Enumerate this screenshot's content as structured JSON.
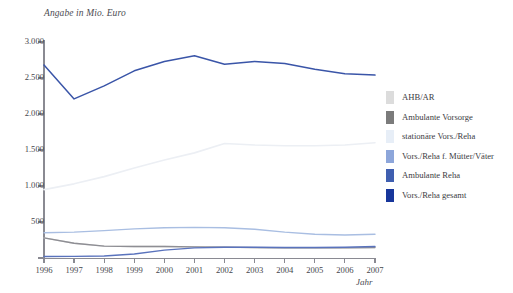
{
  "header": {
    "clipped_line_a": "",
    "clipped_line_b": ""
  },
  "chart": {
    "subtitle": "Angabe in Mio. Euro",
    "xaxis_title": "Jahr"
  },
  "legend": {
    "items": [
      {
        "label": "AHB/AR",
        "color": "#dcdcdc"
      },
      {
        "label": "Ambulante Vorsorge",
        "color": "#7b7b7b"
      },
      {
        "label": "stationäre Vors./Reha",
        "color": "#e7eef7"
      },
      {
        "label": "Vors./Reha f. Mütter/Väter",
        "color": "#8da6da"
      },
      {
        "label": "Ambulante Reha",
        "color": "#3f5fb0"
      },
      {
        "label": "Vors./Reha gesamt",
        "color": "#17369b"
      }
    ]
  },
  "chart_data": {
    "type": "line",
    "title": "",
    "subtitle": "Angabe in Mio. Euro",
    "xlabel": "Jahr",
    "ylabel": "",
    "grid": false,
    "legend_position": "right",
    "x": [
      1996,
      1997,
      1998,
      1999,
      2000,
      2001,
      2002,
      2003,
      2004,
      2005,
      2006,
      2007
    ],
    "categories": [
      "1996",
      "1997",
      "1998",
      "1999",
      "2000",
      "2001",
      "2002",
      "2003",
      "2004",
      "2005",
      "2006",
      "2007"
    ],
    "xlim": [
      1996,
      2007
    ],
    "ylim": [
      0,
      3000
    ],
    "yticks": [
      0,
      500,
      1000,
      1500,
      2000,
      2500,
      3000
    ],
    "ytick_labels": [
      "",
      "500",
      "1.000",
      "1.500",
      "2.000",
      "2.500",
      "3.000"
    ],
    "series": [
      {
        "name": "Vors./Reha gesamt",
        "color": "#3a55a8",
        "width": 1.5,
        "values": [
          2680,
          2210,
          2390,
          2600,
          2730,
          2810,
          2690,
          2730,
          2700,
          2620,
          2560,
          2540
        ]
      },
      {
        "name": "stationäre Vors./Reha",
        "color": "#eceff4",
        "width": 1.6,
        "values": [
          950,
          1030,
          1130,
          1250,
          1360,
          1460,
          1590,
          1570,
          1560,
          1560,
          1570,
          1600
        ]
      },
      {
        "name": "Vors./Reha f. Mütter/Väter",
        "color": "#a9bee2",
        "width": 1.4,
        "values": [
          350,
          360,
          380,
          405,
          420,
          425,
          420,
          400,
          360,
          330,
          320,
          330
        ]
      },
      {
        "name": "AHB/AR",
        "color": "#d6d6d6",
        "width": 1.4,
        "values": [
          280,
          205,
          165,
          160,
          160,
          155,
          150,
          145,
          140,
          140,
          140,
          145
        ]
      },
      {
        "name": "Ambulante Vorsorge",
        "color": "#8e8e94",
        "width": 1.3,
        "values": [
          280,
          205,
          165,
          160,
          160,
          155,
          150,
          145,
          140,
          140,
          140,
          145
        ]
      },
      {
        "name": "Ambulante Reha",
        "color": "#5a73bd",
        "width": 1.4,
        "values": [
          20,
          22,
          28,
          55,
          110,
          140,
          150,
          150,
          145,
          145,
          150,
          160
        ]
      }
    ]
  }
}
